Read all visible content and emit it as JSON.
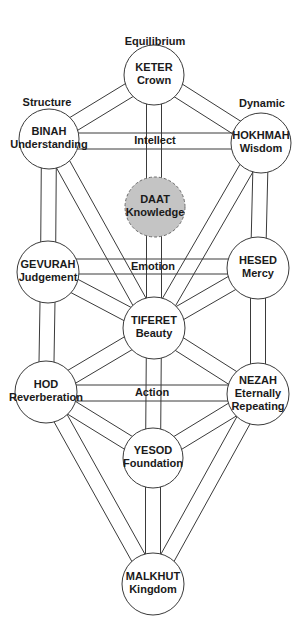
{
  "pillars": [
    {
      "id": "structure",
      "label": "Structure",
      "x": 47,
      "y": 103
    },
    {
      "id": "equilibrium",
      "label": "Equilibrium",
      "x": 155,
      "y": 42
    },
    {
      "id": "dynamic",
      "label": "Dynamic",
      "x": 262,
      "y": 104
    }
  ],
  "nodes": [
    {
      "id": "keter",
      "name": "KETER",
      "meaning": "Crown",
      "cx": 154,
      "cy": 75,
      "r": 30,
      "hidden": false
    },
    {
      "id": "binah",
      "name": "BINAH",
      "meaning": "Understanding",
      "cx": 49,
      "cy": 139,
      "r": 30,
      "hidden": false
    },
    {
      "id": "hokhmah",
      "name": "HOKHMAH",
      "meaning": "Wisdom",
      "cx": 261,
      "cy": 143,
      "r": 30,
      "hidden": false
    },
    {
      "id": "daat",
      "name": "DAAT",
      "meaning": "Knowledge",
      "cx": 155,
      "cy": 207,
      "r": 30,
      "hidden": true
    },
    {
      "id": "gevurah",
      "name": "GEVURAH",
      "meaning": "Judgement",
      "cx": 48,
      "cy": 272,
      "r": 31,
      "hidden": false
    },
    {
      "id": "hesed",
      "name": "HESED",
      "meaning": "Mercy",
      "cx": 258,
      "cy": 268,
      "r": 31,
      "hidden": false
    },
    {
      "id": "tiferet",
      "name": "TIFERET",
      "meaning": "Beauty",
      "cx": 154,
      "cy": 328,
      "r": 31,
      "hidden": false
    },
    {
      "id": "hod",
      "name": "HOD",
      "meaning": "Reverberation",
      "cx": 46,
      "cy": 392,
      "r": 31,
      "hidden": false
    },
    {
      "id": "nezah",
      "name": "NEZAH",
      "meaning": "Eternally Repeating",
      "meaning_lines": [
        "Eternally",
        "Repeating"
      ],
      "cx": 258,
      "cy": 394,
      "r": 31,
      "hidden": false
    },
    {
      "id": "yesod",
      "name": "YESOD",
      "meaning": "Foundation",
      "cx": 153,
      "cy": 458,
      "r": 30,
      "hidden": false
    },
    {
      "id": "malkhut",
      "name": "MALKHUT",
      "meaning": "Kingdom",
      "cx": 153,
      "cy": 584,
      "r": 31,
      "hidden": false
    }
  ],
  "bars": [
    {
      "id": "intellect",
      "label": "Intellect",
      "from": "binah",
      "to": "hokhmah",
      "y1": 133,
      "y2": 149
    },
    {
      "id": "emotion",
      "label": "Emotion",
      "from": "gevurah",
      "to": "hesed",
      "y1": 259,
      "y2": 274
    },
    {
      "id": "action",
      "label": "Action",
      "from": "hod",
      "to": "nezah",
      "y1": 385,
      "y2": 401
    }
  ],
  "paths": [
    [
      "keter",
      "binah"
    ],
    [
      "keter",
      "hokhmah"
    ],
    [
      "keter",
      "tiferet"
    ],
    [
      "binah",
      "gevurah"
    ],
    [
      "hokhmah",
      "hesed"
    ],
    [
      "binah",
      "tiferet"
    ],
    [
      "hokhmah",
      "tiferet"
    ],
    [
      "gevurah",
      "tiferet"
    ],
    [
      "hesed",
      "tiferet"
    ],
    [
      "gevurah",
      "hod"
    ],
    [
      "hesed",
      "nezah"
    ],
    [
      "tiferet",
      "hod"
    ],
    [
      "tiferet",
      "nezah"
    ],
    [
      "tiferet",
      "yesod"
    ],
    [
      "hod",
      "yesod"
    ],
    [
      "nezah",
      "yesod"
    ],
    [
      "hod",
      "malkhut"
    ],
    [
      "nezah",
      "malkhut"
    ],
    [
      "yesod",
      "malkhut"
    ]
  ],
  "channel_width": 15,
  "colors": {
    "line": "#3a3a3a",
    "node_fill": "#ffffff",
    "hidden_node_fill": "#c4c4c4",
    "text": "#1a1a1a",
    "background": "#ffffff"
  }
}
